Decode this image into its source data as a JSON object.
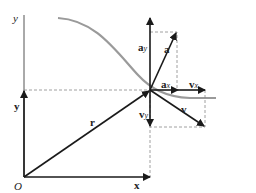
{
  "diagram": {
    "axes": {
      "y_label": "y",
      "origin_label": "O"
    },
    "vectors": {
      "r": "r",
      "x": "x",
      "y": "y",
      "a": "a",
      "a_x": "a",
      "a_x_sub": "x",
      "a_y": "a",
      "a_y_sub": "y",
      "v": "v",
      "v_x": "v",
      "v_x_sub": "x",
      "v_y": "v",
      "v_y_sub": "y"
    },
    "colors": {
      "vector": "#1a1a1a",
      "curve": "#9a9a9a",
      "dashed": "#888888",
      "axis": "#555555"
    }
  }
}
